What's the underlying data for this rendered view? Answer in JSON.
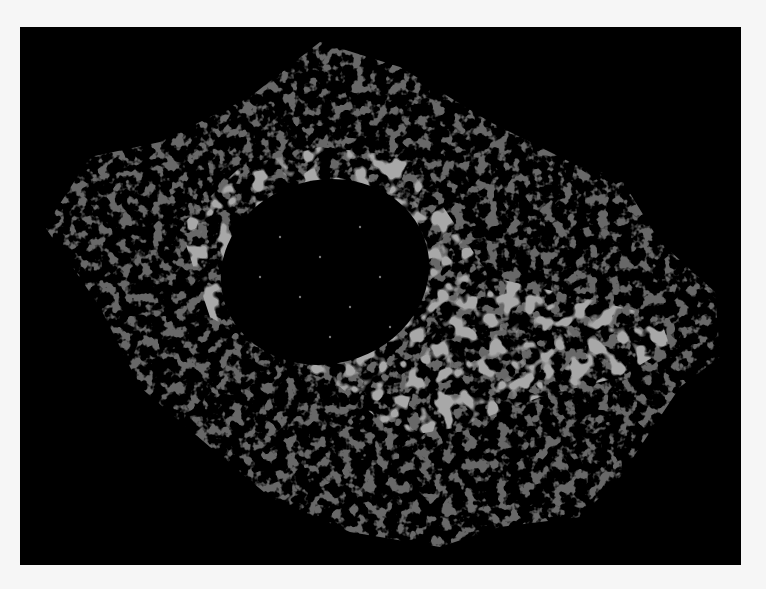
{
  "image": {
    "subject": "fluorescence micrograph of a cell showing filament network around a dark nucleus",
    "colors": {
      "background": "#000000",
      "border": "#f6f6f6",
      "filaments": "#7a7a7a",
      "bright_network": "#a8a8a8"
    }
  }
}
